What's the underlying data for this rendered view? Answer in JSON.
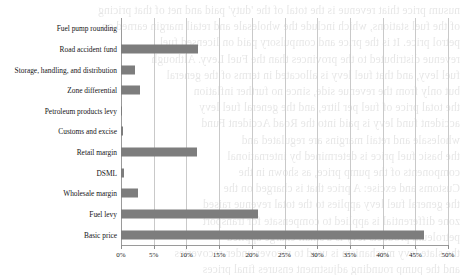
{
  "background_texts": [
    "nusum price thiat revenue is the total of the 'duty' paid and net of that pricing",
    "of the fuel stations, which include the wholesale and retail margin earned on",
    "petrol price. It is the price and compulsory paid on licensed fuel",
    "revenue distributed to the provinces than the Fuel Levy. Although",
    "fuel levy, and that fuel levy is allocated in terms of the general",
    "but only from the revenue side, since no further inflation",
    "the total price of fuel per litre, and the general fuel levy",
    "accident fund levy is paid into the Road Accident Fund",
    "wholesale and retail margins are regulated and",
    "the basic fuel price is determined by international",
    "components of the pump price, as shown in the",
    "Customs and excise: A price that is charged on the",
    "the general fuel levy applies to the total revenue raised",
    "zone differential is applied to compensate for transport",
    "petroleum products levy is a small charge applied",
    "the slate levy mechanism is used to recover under-recoveries",
    "and the pump rounding adjustment ensures final prices"
  ],
  "chart_data": {
    "type": "bar",
    "orientation": "horizontal",
    "title": "",
    "xlabel": "",
    "ylabel": "",
    "xlim": [
      0,
      50
    ],
    "grid": true,
    "legend": false,
    "bar_color": "#7d7d7d",
    "categories": [
      "Fuel pump rounding",
      "Road accident fund",
      "Storage, handling, and distribution",
      "Zone differential",
      "Petroleum products levy",
      "Customs and excise",
      "Retail margin",
      "DSML",
      "Wholesale margin",
      "Fuel levy",
      "Basic price"
    ],
    "values": [
      0.0,
      11.8,
      2.1,
      2.9,
      0.15,
      0.3,
      11.6,
      0.5,
      2.6,
      20.9,
      46.3
    ],
    "xticks": [
      0,
      5,
      10,
      15,
      20,
      25,
      30,
      35,
      40,
      45,
      50
    ],
    "xticklabels": [
      "0%",
      "5%",
      "10%",
      "15%",
      "20%",
      "25%",
      "30%",
      "35%",
      "40%",
      "45%",
      "50%"
    ]
  }
}
